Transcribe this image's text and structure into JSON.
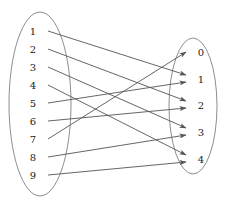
{
  "figure": {
    "title": "",
    "type": "bipartite-mapping-diagram",
    "colors": {
      "ellipse_stroke": "#808080",
      "edge_stroke": "#555555",
      "label_color": "#1a1a1a",
      "background": "#ffffff"
    },
    "domain": {
      "name": "",
      "ellipse": {
        "cx": 40,
        "cy": 104,
        "rx": 31,
        "ry": 92
      },
      "nodes": [
        {
          "label": "1",
          "x": 33,
          "y": 31,
          "anchor_x": 48,
          "anchor_y": 31
        },
        {
          "label": "2",
          "x": 33,
          "y": 49,
          "anchor_x": 48,
          "anchor_y": 49
        },
        {
          "label": "3",
          "x": 33,
          "y": 67,
          "anchor_x": 48,
          "anchor_y": 67
        },
        {
          "label": "4",
          "x": 33,
          "y": 85,
          "anchor_x": 48,
          "anchor_y": 85
        },
        {
          "label": "5",
          "x": 33,
          "y": 103,
          "anchor_x": 48,
          "anchor_y": 103
        },
        {
          "label": "6",
          "x": 33,
          "y": 121,
          "anchor_x": 48,
          "anchor_y": 121
        },
        {
          "label": "7",
          "x": 33,
          "y": 139,
          "anchor_x": 48,
          "anchor_y": 139
        },
        {
          "label": "8",
          "x": 33,
          "y": 157,
          "anchor_x": 48,
          "anchor_y": 157
        },
        {
          "label": "9",
          "x": 33,
          "y": 175,
          "anchor_x": 48,
          "anchor_y": 175
        }
      ]
    },
    "codomain": {
      "name": "",
      "ellipse": {
        "cx": 193,
        "cy": 106,
        "rx": 24,
        "ry": 68
      },
      "nodes": [
        {
          "label": "0",
          "x": 201,
          "y": 52,
          "anchor_x": 189,
          "anchor_y": 52
        },
        {
          "label": "1",
          "x": 201,
          "y": 79,
          "anchor_x": 189,
          "anchor_y": 79
        },
        {
          "label": "2",
          "x": 201,
          "y": 105,
          "anchor_x": 189,
          "anchor_y": 105
        },
        {
          "label": "3",
          "x": 201,
          "y": 132,
          "anchor_x": 189,
          "anchor_y": 132
        },
        {
          "label": "4",
          "x": 201,
          "y": 159,
          "anchor_x": 189,
          "anchor_y": 159
        }
      ]
    },
    "edges": [
      {
        "from": "1",
        "to": "1",
        "x1": 48,
        "y1": 31,
        "x2": 186,
        "y2": 75
      },
      {
        "from": "2",
        "to": "2",
        "x1": 48,
        "y1": 49,
        "x2": 186,
        "y2": 101
      },
      {
        "from": "3",
        "to": "3",
        "x1": 48,
        "y1": 67,
        "x2": 186,
        "y2": 128
      },
      {
        "from": "4",
        "to": "4",
        "x1": 48,
        "y1": 85,
        "x2": 186,
        "y2": 155
      },
      {
        "from": "5",
        "to": "1",
        "x1": 48,
        "y1": 103,
        "x2": 186,
        "y2": 82
      },
      {
        "from": "6",
        "to": "2",
        "x1": 48,
        "y1": 121,
        "x2": 186,
        "y2": 108
      },
      {
        "from": "7",
        "to": "0",
        "x1": 48,
        "y1": 139,
        "x2": 186,
        "y2": 52
      },
      {
        "from": "8",
        "to": "3",
        "x1": 48,
        "y1": 157,
        "x2": 186,
        "y2": 135
      },
      {
        "from": "9",
        "to": "4",
        "x1": 48,
        "y1": 175,
        "x2": 186,
        "y2": 162
      }
    ]
  }
}
